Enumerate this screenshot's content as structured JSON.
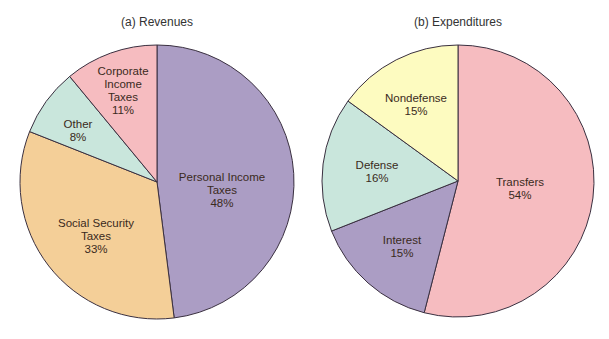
{
  "chart_data": [
    {
      "type": "pie",
      "title": "(a) Revenues",
      "labels": [
        "Personal Income Taxes",
        "Social Security Taxes",
        "Other",
        "Corporate Income Taxes"
      ],
      "values": [
        48,
        33,
        8,
        11
      ],
      "colors": [
        "#ab9dc4",
        "#f4cf98",
        "#c9e6dc",
        "#f6bcc0"
      ],
      "display": [
        {
          "lines": [
            "Personal Income",
            "Taxes",
            "48%"
          ]
        },
        {
          "lines": [
            "Social Security",
            "Taxes",
            "33%"
          ]
        },
        {
          "lines": [
            "Other",
            "8%"
          ]
        },
        {
          "lines": [
            "Corporate",
            "Income",
            "Taxes",
            "11%"
          ]
        }
      ]
    },
    {
      "type": "pie",
      "title": "(b) Expenditures",
      "labels": [
        "Transfers",
        "Interest",
        "Defense",
        "Nondefense"
      ],
      "values": [
        54,
        15,
        16,
        15
      ],
      "colors": [
        "#f6bcc0",
        "#ab9dc4",
        "#c9e6dc",
        "#fdfbc0"
      ],
      "display": [
        {
          "lines": [
            "Transfers",
            "54%"
          ]
        },
        {
          "lines": [
            "Interest",
            "15%"
          ]
        },
        {
          "lines": [
            "Defense",
            "16%"
          ]
        },
        {
          "lines": [
            "Nondefense",
            "15%"
          ]
        }
      ]
    }
  ]
}
